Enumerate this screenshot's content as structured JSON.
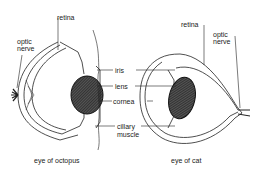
{
  "diagram": {
    "octopus": {
      "caption": "eye of octopus",
      "labels": {
        "retina": "retina",
        "optic_nerve_1": "optic",
        "optic_nerve_2": "nerve"
      }
    },
    "shared_labels": {
      "iris": "iris",
      "lens": "lens",
      "cornea": "cornea",
      "ciliary_1": "cillary",
      "ciliary_2": "muscle"
    },
    "cat": {
      "caption": "eye of cat",
      "labels": {
        "retina": "retina",
        "optic_nerve_1": "optic",
        "optic_nerve_2": "nerve"
      }
    }
  }
}
